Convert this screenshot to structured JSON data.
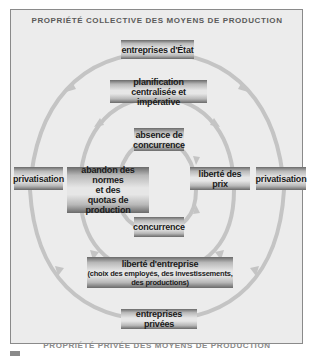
{
  "diagram": {
    "title_top": "PROPRIÉTÉ COLLECTIVE DES MOYENS DE PRODUCTION",
    "title_bottom": "PROPRIÉTÉ PRIVÉE DES MOYENS DE PRODUCTION",
    "colors": {
      "frame_bg": "#ececec",
      "ring": "#c4c4c4",
      "box_dark": "#6a6a6a",
      "box_light": "#e6e6e6",
      "text": "#1a1a1a"
    },
    "boxes": {
      "state_enterprises": "entreprises d'État",
      "planning_line1": "planification",
      "planning_line2": "centralisée et impérative",
      "no_competition_line1": "absence de",
      "no_competition_line2": "concurrence",
      "privatisation_left": "privatisation",
      "abandon_line1": "abandon des normes",
      "abandon_line2": "et des",
      "abandon_line3": "quotas de production",
      "price_freedom": "liberté des prix",
      "privatisation_right": "privatisation",
      "competition": "concurrence",
      "enterprise_freedom_line1": "liberté d'entreprise",
      "enterprise_freedom_line2": "(choix des employés, des investissements,",
      "enterprise_freedom_line3": "des productions)",
      "private_enterprises": "entreprises privées"
    },
    "rings": [
      {
        "name": "outer",
        "from": "entreprises d'État",
        "via": "privatisation",
        "to": "entreprises privées"
      },
      {
        "name": "middle",
        "from": "planification centralisée et impérative",
        "via": [
          "abandon des normes et des quotas de production",
          "liberté des prix"
        ],
        "to": "liberté d'entreprise"
      },
      {
        "name": "inner",
        "from": "absence de concurrence",
        "via": [
          "abandon des normes et des quotas de production",
          "liberté des prix"
        ],
        "to": "concurrence"
      }
    ]
  }
}
